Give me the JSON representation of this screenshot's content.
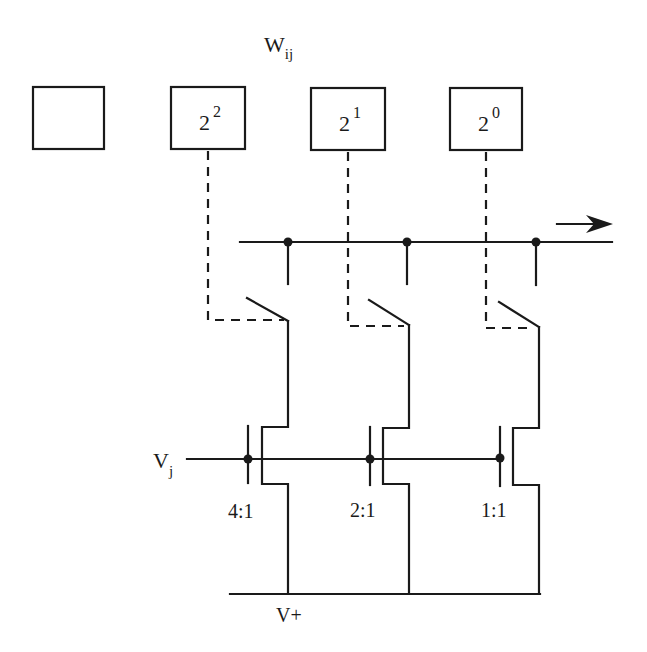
{
  "diagram": {
    "title": {
      "base": "W",
      "sub": "ij"
    },
    "boxes": [
      {
        "base": "",
        "exp": ""
      },
      {
        "base": "2",
        "exp": "2"
      },
      {
        "base": "2",
        "exp": "1"
      },
      {
        "base": "2",
        "exp": "0"
      }
    ],
    "input_label": {
      "base": "V",
      "sub": "j"
    },
    "supply_label": "V+",
    "ratios": [
      "4:1",
      "2:1",
      "1:1"
    ],
    "output_arrow": "right-arrow-icon",
    "colors": {
      "ink": "#1a1a1a",
      "background": "#ffffff"
    }
  }
}
